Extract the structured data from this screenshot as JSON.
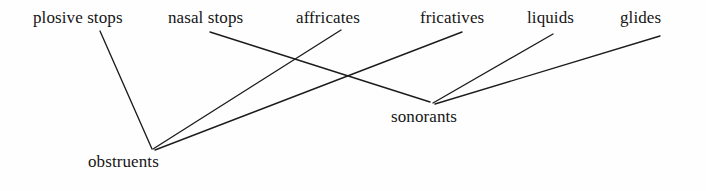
{
  "diagram": {
    "type": "tree",
    "background_color": "#fefefe",
    "line_color": "#1c1c1c",
    "text_color": "#151515",
    "leaf_nodes": [
      {
        "id": "plosive-stops",
        "label": "plosive stops",
        "x": 33,
        "y": 10
      },
      {
        "id": "nasal-stops",
        "label": "nasal stops",
        "x": 168,
        "y": 10
      },
      {
        "id": "affricates",
        "label": "affricates",
        "x": 296,
        "y": 10
      },
      {
        "id": "fricatives",
        "label": "fricatives",
        "x": 420,
        "y": 10
      },
      {
        "id": "liquids",
        "label": "liquids",
        "x": 527,
        "y": 10
      },
      {
        "id": "glides",
        "label": "glides",
        "x": 620,
        "y": 10
      }
    ],
    "parent_nodes": [
      {
        "id": "obstruents",
        "label": "obstruents",
        "x": 88,
        "y": 153
      },
      {
        "id": "sonorants",
        "label": "sonorants",
        "x": 391,
        "y": 108
      }
    ],
    "edges": [
      {
        "id": "edge-plosive-stops-obstruents",
        "from": "plosive-stops",
        "to": "obstruents",
        "x1": 100,
        "y1": 31,
        "x2": 152,
        "y2": 149
      },
      {
        "id": "edge-affricates-obstruents",
        "from": "affricates",
        "to": "obstruents",
        "x1": 341,
        "y1": 30,
        "x2": 153,
        "y2": 149
      },
      {
        "id": "edge-fricatives-obstruents",
        "from": "fricatives",
        "to": "obstruents",
        "x1": 462,
        "y1": 32,
        "x2": 155,
        "y2": 150
      },
      {
        "id": "edge-nasal-stops-sonorants",
        "from": "nasal-stops",
        "to": "sonorants",
        "x1": 210,
        "y1": 32,
        "x2": 430,
        "y2": 102
      },
      {
        "id": "edge-liquids-sonorants",
        "from": "liquids",
        "to": "sonorants",
        "x1": 553,
        "y1": 34,
        "x2": 433,
        "y2": 103
      },
      {
        "id": "edge-glides-sonorants",
        "from": "glides",
        "to": "sonorants",
        "x1": 660,
        "y1": 36,
        "x2": 435,
        "y2": 104
      }
    ]
  }
}
